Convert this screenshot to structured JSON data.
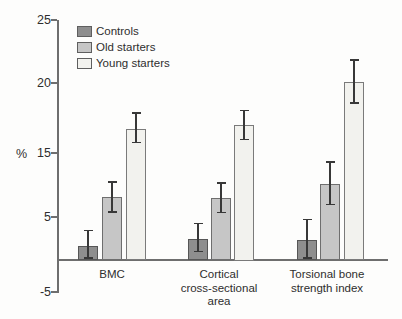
{
  "figure": {
    "background": "#fdfdfc",
    "axis_color": "#6e6e6e",
    "error_bar_color": "#383838",
    "text_color": "#2e2e2e"
  },
  "chart_data": {
    "type": "bar",
    "title": "",
    "xlabel": "",
    "ylabel": "%",
    "grid": false,
    "legend_position": "top-left-inside",
    "yticks": [
      25,
      20,
      15,
      5,
      -5
    ],
    "ylim": [
      -5,
      25
    ],
    "baseline": 0,
    "categories": [
      "BMC",
      "Cortical cross-sectional area",
      "Torsional bone strength index"
    ],
    "category_lines": [
      [
        "BMC"
      ],
      [
        "Cortical",
        "cross-sectional",
        "area"
      ],
      [
        "Torsional bone",
        "strength index"
      ]
    ],
    "series": [
      {
        "name": "Controls",
        "fill": "#8e8e8e",
        "border": "#565656",
        "values": [
          1.6,
          2.4,
          2.3
        ],
        "err_low": [
          0,
          0.8,
          0
        ],
        "err_high": [
          3.5,
          4.3,
          4.8
        ]
      },
      {
        "name": "Old starters",
        "fill": "#c6c6c6",
        "border": "#6e6e6e",
        "values": [
          8.1,
          8.0,
          10.1
        ],
        "err_low": [
          5.7,
          5.6,
          6.8
        ],
        "err_high": [
          10.6,
          10.4,
          13.7
        ]
      },
      {
        "name": "Young starters",
        "fill": "#f2f2ee",
        "border": "#7a7a7a",
        "values": [
          16.7,
          17.0,
          20.1
        ],
        "err_low": [
          15.7,
          15.9,
          18.5
        ],
        "err_high": [
          17.9,
          18.1,
          21.9
        ]
      }
    ]
  }
}
